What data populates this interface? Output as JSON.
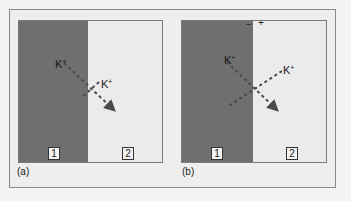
{
  "figure": {
    "panels": [
      {
        "caption": "(a)",
        "compartments": [
          {
            "label": "1",
            "shade": "#6f6f6f"
          },
          {
            "label": "2",
            "shade": "#ebebeb"
          }
        ],
        "ions": [
          {
            "symbol": "K",
            "charge": "+"
          },
          {
            "symbol": "K",
            "charge": "+"
          }
        ],
        "charges": []
      },
      {
        "caption": "(b)",
        "compartments": [
          {
            "label": "1",
            "shade": "#6f6f6f"
          },
          {
            "label": "2",
            "shade": "#ebebeb"
          }
        ],
        "ions": [
          {
            "symbol": "K",
            "charge": "+"
          },
          {
            "symbol": "K",
            "charge": "+"
          }
        ],
        "charges": [
          {
            "sign": "−",
            "side": "left"
          },
          {
            "sign": "+",
            "side": "right"
          }
        ]
      }
    ],
    "colors": {
      "dark_compartment": "#6f6f6f",
      "light_compartment": "#ebebeb",
      "arrow": "#555555"
    }
  }
}
